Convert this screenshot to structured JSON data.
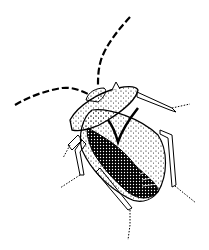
{
  "image": {
    "subject": "Shield bug illustration",
    "description": "Black-and-white stippled pen-and-ink drawing of a shield bug viewed from above at an angle, with long segmented antennae and jointed legs",
    "background_color": "#ffffff",
    "ink_color": "#000000"
  }
}
